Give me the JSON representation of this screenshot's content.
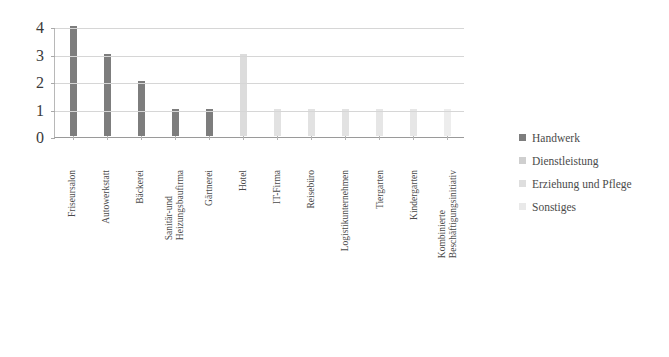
{
  "chart_data": {
    "type": "bar",
    "title": "",
    "subtitle": "",
    "xlabel": "",
    "ylabel": "",
    "ylim": [
      0,
      4
    ],
    "yticks": [
      "0",
      "1",
      "2",
      "3",
      "4"
    ],
    "grid": true,
    "legend_position": "right",
    "categories": [
      "Friseursalon",
      "Autowerkstatt",
      "Bäckerei",
      "Sanitär-und Heizungsbaufirma",
      "Gärtnerei",
      "Hotel",
      "IT-Firma",
      "Reisebüro",
      "Logistikunternehmen",
      "Tiergarten",
      "Kindergarten",
      "Kombinierte Beschäftigungsinitiativ"
    ],
    "category_lines": [
      [
        "Friseursalon"
      ],
      [
        "Autowerkstatt"
      ],
      [
        "Bäckerei"
      ],
      [
        "Sanitär-und",
        "Heizungsbaufirma"
      ],
      [
        "Gärtnerei"
      ],
      [
        "Hotel"
      ],
      [
        "IT-Firma"
      ],
      [
        "Reisebüro"
      ],
      [
        "Logistikunternehmen"
      ],
      [
        "Tiergarten"
      ],
      [
        "Kindergarten"
      ],
      [
        "Kombinierte",
        "Beschäftigungsinitiativ"
      ]
    ],
    "values": [
      4,
      3,
      2,
      1,
      1,
      3,
      1,
      1,
      1,
      1,
      1,
      1
    ],
    "bar_series": [
      "Handwerk",
      "Handwerk",
      "Handwerk",
      "Handwerk",
      "Handwerk",
      "Dienstleistung",
      "Dienstleistung",
      "Dienstleistung",
      "Dienstleistung",
      "Erziehung und Pflege",
      "Erziehung und Pflege",
      "Sonstiges"
    ],
    "bar_colors": [
      "#7d7d7d",
      "#7d7d7d",
      "#7d7d7d",
      "#7d7d7d",
      "#7d7d7d",
      "#dcdcdc",
      "#e2e2e2",
      "#e2e2e2",
      "#e2e2e2",
      "#e6e6e6",
      "#e6e6e6",
      "#ededed"
    ],
    "series": [
      {
        "name": "Handwerk",
        "color": "#7d7d7d"
      },
      {
        "name": "Dienstleistung",
        "color": "#cfcfcf"
      },
      {
        "name": "Erziehung und Pflege",
        "color": "#dedede"
      },
      {
        "name": "Sonstiges",
        "color": "#e9e9e9"
      }
    ]
  },
  "legend": {
    "items": [
      {
        "label": "Handwerk",
        "color": "#7d7d7d"
      },
      {
        "label": "Dienstleistung",
        "color": "#cfcfcf"
      },
      {
        "label": "Erziehung und Pflege",
        "color": "#dedede"
      },
      {
        "label": "Sonstiges",
        "color": "#e9e9e9"
      }
    ]
  }
}
